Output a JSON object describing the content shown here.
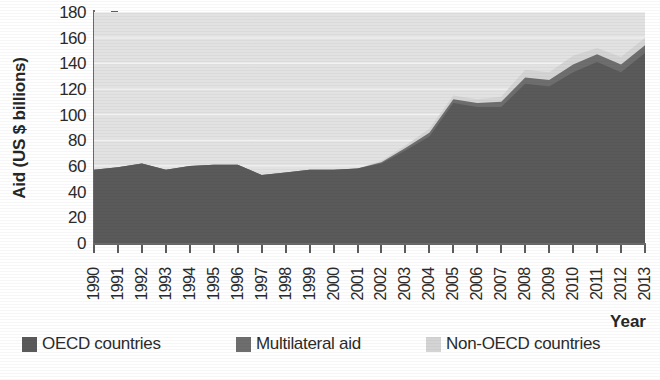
{
  "chart_data": {
    "type": "area",
    "title": "",
    "xlabel": "Year",
    "ylabel": "Aid (US $ billions)",
    "ylim": [
      0,
      180
    ],
    "yticks": [
      0,
      20,
      40,
      60,
      80,
      100,
      120,
      140,
      160,
      180
    ],
    "grid": true,
    "stacked": true,
    "legend_position": "bottom",
    "plot_background": "#e2e2e2",
    "categories": [
      "1990",
      "1991",
      "1992",
      "1993",
      "1994",
      "1995",
      "1996",
      "1997",
      "1998",
      "1999",
      "2000",
      "2001",
      "2002",
      "2003",
      "2004",
      "2005",
      "2006",
      "2007",
      "2008",
      "2009",
      "2010",
      "2011",
      "2012",
      "2013"
    ],
    "series": [
      {
        "name": "OECD countries",
        "color": "#5a5a5a",
        "values": [
          57,
          59,
          62,
          57,
          60,
          61,
          61,
          53,
          55,
          57,
          57,
          58,
          62,
          72,
          83,
          109,
          106,
          106,
          124,
          122,
          133,
          141,
          133,
          148
        ]
      },
      {
        "name": "Multilateral aid",
        "color": "#6e6e6e",
        "values": [
          0,
          0,
          0,
          0,
          0,
          0,
          0,
          0,
          0,
          0,
          0,
          0,
          1,
          2,
          3,
          3,
          3,
          4,
          5,
          5,
          6,
          6,
          6,
          6
        ]
      },
      {
        "name": "Non-OECD countries",
        "color": "#d4d4d4",
        "values": [
          0,
          0,
          0,
          0,
          0,
          0,
          0,
          0,
          0,
          0,
          0,
          0,
          1,
          2,
          3,
          3,
          3,
          4,
          6,
          6,
          7,
          5,
          6,
          6
        ]
      }
    ],
    "totals": [
      57,
      59,
      62,
      57,
      60,
      61,
      61,
      53,
      55,
      57,
      57,
      58,
      64,
      76,
      89,
      115,
      112,
      114,
      135,
      133,
      146,
      152,
      145,
      160
    ]
  },
  "legend": [
    {
      "label": "OECD countries",
      "color": "#5a5a5a"
    },
    {
      "label": "Multilateral aid",
      "color": "#6e6e6e"
    },
    {
      "label": "Non-OECD countries",
      "color": "#d4d4d4"
    }
  ],
  "axes": {
    "y_title": "Aid (US $ billions)",
    "x_title": "Year"
  },
  "caption": ""
}
